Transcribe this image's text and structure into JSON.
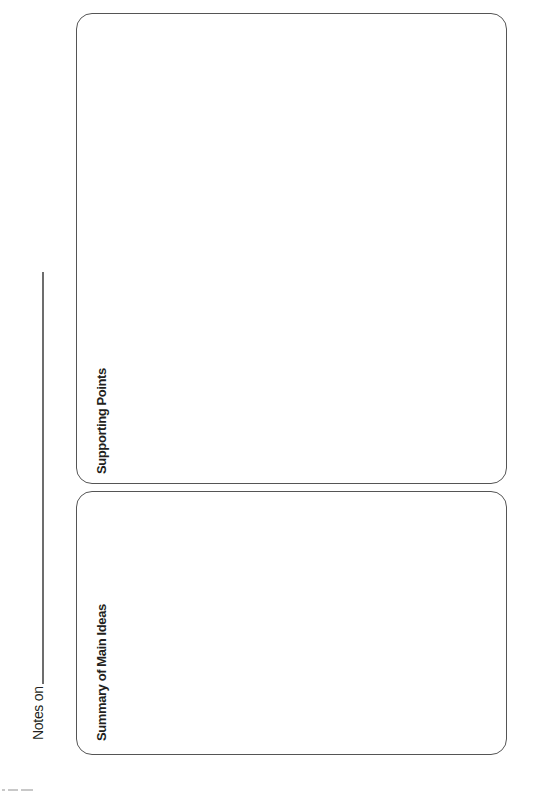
{
  "header": {
    "notes_label": "Notes on"
  },
  "sections": [
    {
      "id": "supporting-points",
      "heading": "Supporting Points"
    },
    {
      "id": "summary-main-ideas",
      "heading": "Summary of Main Ideas"
    }
  ],
  "colors": {
    "border": "#555555",
    "text": "#231f20",
    "background": "#ffffff"
  }
}
